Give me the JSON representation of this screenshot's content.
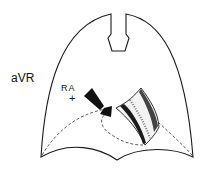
{
  "diagram": {
    "lead_label": "aVR",
    "electrode_label": "RA",
    "polarity_symbol": "+",
    "colors": {
      "line": "#1a1a1a",
      "background": "#ffffff"
    }
  }
}
